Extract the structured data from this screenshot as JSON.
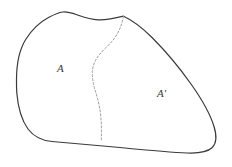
{
  "diagram": {
    "background_color": "#ffffff",
    "boundary": {
      "name": "outer-region-boundary",
      "stroke_color": "#3a3a3a",
      "stroke_width": 1.2,
      "style": "solid",
      "closed": true
    },
    "divider": {
      "name": "dashed-partition-curve",
      "stroke_color": "#9a9a9a",
      "stroke_width": 1,
      "style": "dashed",
      "dash_pattern": "2 2"
    },
    "labels": [
      {
        "id": "label-a",
        "text": "A",
        "region": "left",
        "x": 57,
        "y": 63,
        "font_style": "italic",
        "color": "#3a3a3a"
      },
      {
        "id": "label-a-prime",
        "text": "A′",
        "region": "right",
        "x": 157,
        "y": 88,
        "font_style": "italic",
        "color": "#3a3a3a"
      }
    ]
  },
  "chart_data": {
    "type": "diagram",
    "title": "",
    "xlabel": "",
    "ylabel": "",
    "categories": [
      "A",
      "A′"
    ],
    "annotations": [
      "A",
      "A′"
    ],
    "shapes": [
      {
        "name": "outer-region-boundary",
        "kind": "closed-freeform-blob",
        "path": "M 16 78 C 16 50 26 30 44 19 C 56 12 62 11 66 12 C 76 14 84 18 94 19 C 104 20 114 18 125 16 C 140 21 160 40 180 65 C 198 88 212 112 215 131 C 217 143 214 149 206 152 C 196 156 160 155 120 152 C 84 149 56 145 42 142 C 30 139 22 128 18 110 C 16 100 16 88 16 78 Z",
        "stroke": "#3a3a3a",
        "fill": "none"
      },
      {
        "name": "dashed-partition-curve",
        "kind": "open-s-curve",
        "path": "M 125 16 C 122 28 116 38 108 46 C 100 54 94 60 93 70 C 92 82 97 94 99 108 C 101 120 101 131 101 141",
        "stroke": "#9a9a9a",
        "fill": "none",
        "dash": "2 2"
      }
    ],
    "legend": [],
    "grid": false
  }
}
